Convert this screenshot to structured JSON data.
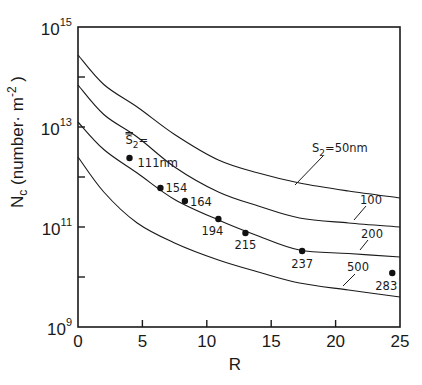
{
  "chart_data": {
    "type": "line",
    "title": "",
    "xlabel": "R",
    "ylabel": "N_c (number·m^-2)",
    "ylabel_parts": {
      "main": "N",
      "sub": "c",
      "unit": "(number· m",
      "unit_sup": "-2",
      "close": ")"
    },
    "xscale": "linear",
    "yscale": "log",
    "xlim": [
      0,
      25
    ],
    "ylim": [
      1000000000.0,
      1000000000000000.0
    ],
    "x_ticks": [
      0,
      5,
      10,
      15,
      20,
      25
    ],
    "x_tick_labels": [
      "0",
      "5",
      "10",
      "15",
      "20",
      "25"
    ],
    "y_ticks_log10": [
      9,
      10,
      11,
      12,
      13,
      14,
      15
    ],
    "y_tick_labels": [
      {
        "log10": 15,
        "base": "10",
        "exp": "15"
      },
      {
        "log10": 13,
        "base": "10",
        "exp": "13"
      },
      {
        "log10": 11,
        "base": "10",
        "exp": "11"
      },
      {
        "log10": 9,
        "base": "10",
        "exp": "9"
      }
    ],
    "grid": false,
    "series": [
      {
        "name": "S2=50nm",
        "label": "S₂=50nm",
        "x": [
          0,
          2,
          4.6,
          7.5,
          10.9,
          14,
          17.2,
          21,
          25
        ],
        "log10_y": [
          14.44,
          13.85,
          13.4,
          12.85,
          12.34,
          12.08,
          11.88,
          11.72,
          11.58
        ]
      },
      {
        "name": "S2=100nm",
        "label": "100",
        "x": [
          0,
          2,
          4.6,
          7.5,
          10.9,
          14,
          17.2,
          21,
          25
        ],
        "log10_y": [
          13.84,
          13.25,
          12.8,
          12.2,
          11.7,
          11.42,
          11.18,
          11.08,
          11.0
        ]
      },
      {
        "name": "S2=200nm",
        "label": "200",
        "x": [
          0,
          2,
          4.6,
          7.5,
          10.9,
          14,
          17.2,
          21,
          25
        ],
        "log10_y": [
          13.1,
          12.55,
          12.08,
          11.55,
          11.14,
          10.82,
          10.54,
          10.47,
          10.4
        ]
      },
      {
        "name": "S2=500nm",
        "label": "500",
        "x": [
          0,
          2,
          4.6,
          7.5,
          10.9,
          14,
          17.2,
          21,
          25
        ],
        "log10_y": [
          12.4,
          11.7,
          11.08,
          10.68,
          10.34,
          10.1,
          9.88,
          9.74,
          9.6
        ]
      }
    ],
    "points": {
      "name": "measured mean S2",
      "header": "S̄₂=",
      "values": [
        {
          "R": 4.0,
          "log10_y": 12.38,
          "label": "111nm"
        },
        {
          "R": 6.4,
          "log10_y": 11.78,
          "label": "154"
        },
        {
          "R": 8.3,
          "log10_y": 11.52,
          "label": "164"
        },
        {
          "R": 10.9,
          "log10_y": 11.16,
          "label": "194"
        },
        {
          "R": 13.0,
          "log10_y": 10.88,
          "label": "215"
        },
        {
          "R": 17.4,
          "log10_y": 10.52,
          "label": "237"
        },
        {
          "R": 24.4,
          "log10_y": 10.08,
          "label": "283"
        }
      ]
    }
  },
  "colors": {
    "ink": "#1a1a1a",
    "background": "#ffffff"
  }
}
